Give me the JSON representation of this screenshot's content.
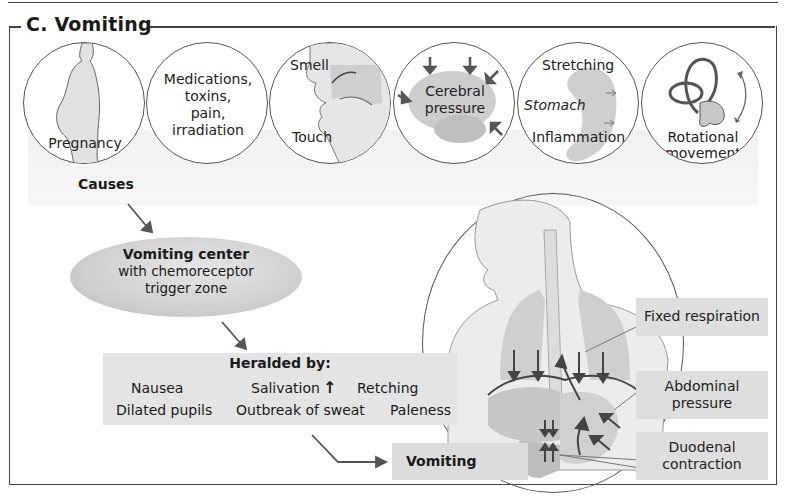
{
  "figure": {
    "title": "C. Vomiting"
  },
  "causes": {
    "label": "Causes",
    "items": [
      {
        "id": "pregnancy",
        "lines": [
          "Pregnancy"
        ]
      },
      {
        "id": "medications",
        "lines": [
          "Medications,",
          "toxins,",
          "pain,",
          "irradiation"
        ]
      },
      {
        "id": "smell-touch",
        "lines": [
          "Smell",
          "Touch"
        ]
      },
      {
        "id": "cerebral",
        "lines": [
          "Cerebral",
          "pressure"
        ]
      },
      {
        "id": "stomach",
        "lines": [
          "Stretching",
          "Stomach",
          "Inflammation"
        ]
      },
      {
        "id": "rotational",
        "lines": [
          "Rotational",
          "movement"
        ]
      }
    ]
  },
  "vomiting_center": {
    "title": "Vomiting center",
    "line2": "with chemoreceptor",
    "line3": "trigger zone"
  },
  "heralded": {
    "title": "Heralded by:",
    "row1": [
      "Nausea",
      "Salivation",
      "Retching"
    ],
    "row2": [
      "Dilated pupils",
      "Outbreak of sweat",
      "Paleness"
    ],
    "salivation_indicator": "↑"
  },
  "outcome": {
    "label": "Vomiting"
  },
  "mechanisms": [
    {
      "id": "fixed-respiration",
      "lines": [
        "Fixed respiration"
      ]
    },
    {
      "id": "abdominal-pressure",
      "lines": [
        "Abdominal",
        "pressure"
      ]
    },
    {
      "id": "duodenal-contraction",
      "lines": [
        "Duodenal",
        "contraction"
      ]
    }
  ],
  "colors": {
    "frame": "#444444",
    "label_box": "#dedede",
    "herald_box": "#e4e4e4",
    "arrow": "#555555",
    "organ": "#c8c8c8"
  }
}
